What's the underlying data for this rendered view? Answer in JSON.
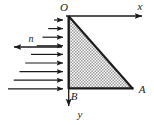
{
  "figure": {
    "type": "engineering-diagram",
    "background_color": "#ffffff",
    "line_color": "#1a1a1a",
    "hatch_color": "#8c8c8c",
    "labels": {
      "origin": "O",
      "x_axis": "x",
      "y_axis": "y",
      "vertex_b": "B",
      "vertex_a": "A",
      "normal": "n"
    },
    "geometry": {
      "origin_x": 68,
      "origin_y": 16,
      "vertex_b_x": 68,
      "vertex_b_y": 89,
      "vertex_a_x": 133,
      "vertex_a_y": 89
    },
    "axes": {
      "x_axis_end_x": 146,
      "y_axis_end_y": 110
    },
    "pressure_arrows": {
      "count": 9,
      "tip_x": 68,
      "start_y": 20,
      "spacing": 8.6,
      "min_length": 14,
      "max_length": 60,
      "direction": "right"
    },
    "normal_arrow": {
      "tail_x": 62,
      "tip_x": 8,
      "y": 47,
      "direction": "left",
      "label_x": 31,
      "label_y": 41
    }
  }
}
